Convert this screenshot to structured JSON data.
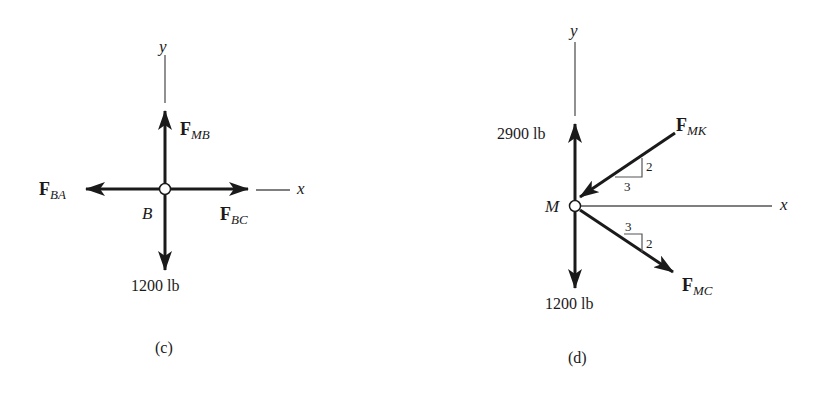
{
  "figures": [
    {
      "id": "c",
      "caption": "(c)",
      "joint": "B",
      "axes": {
        "x": "x",
        "y": "y"
      },
      "forces": [
        {
          "name": "F",
          "sub": "MB",
          "direction": "up"
        },
        {
          "name": "F",
          "sub": "BA",
          "direction": "left"
        },
        {
          "name": "F",
          "sub": "BC",
          "direction": "right"
        },
        {
          "label": "1200 lb",
          "direction": "down"
        }
      ]
    },
    {
      "id": "d",
      "caption": "(d)",
      "joint": "M",
      "axes": {
        "x": "x",
        "y": "y"
      },
      "forces": [
        {
          "label": "2900 lb",
          "direction": "up"
        },
        {
          "label": "1200 lb",
          "direction": "down"
        },
        {
          "name": "F",
          "sub": "MK",
          "direction": "toward joint from upper-right",
          "slope": {
            "rise": "2",
            "run": "3"
          }
        },
        {
          "name": "F",
          "sub": "MC",
          "direction": "away from joint toward lower-right",
          "slope": {
            "rise": "2",
            "run": "3"
          }
        }
      ]
    }
  ]
}
